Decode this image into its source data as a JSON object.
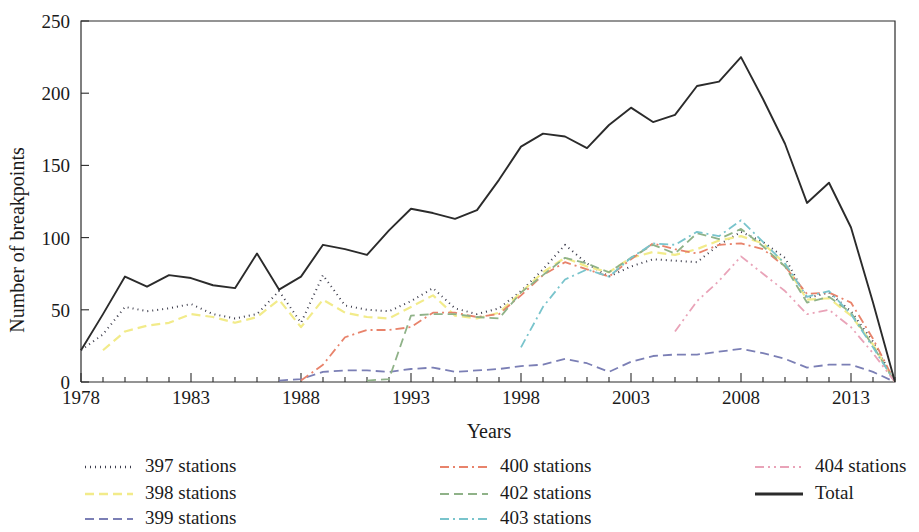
{
  "figure": {
    "background_color": "#ffffff",
    "frame_color": "#2b2b2b"
  },
  "axis": {
    "x_title": "Years",
    "y_title": "Number of breakpoints",
    "x_ticklabels": [
      "1978",
      "1983",
      "1988",
      "1993",
      "1998",
      "2003",
      "2008",
      "2013"
    ],
    "y_ticklabels": [
      "0",
      "50",
      "100",
      "150",
      "200",
      "250"
    ]
  },
  "legend": {
    "entries": [
      {
        "label": "397 stations",
        "color": "#3b3b4a",
        "dash": "1,4",
        "width": 2.0,
        "name": "legend-397"
      },
      {
        "label": "398 stations",
        "color": "#f2eb8a",
        "dash": "9,5",
        "width": 2.2,
        "name": "legend-398"
      },
      {
        "label": "399 stations",
        "color": "#7b7fb5",
        "dash": "9,5",
        "width": 1.8,
        "name": "legend-399"
      },
      {
        "label": "400 stations",
        "color": "#e8836b",
        "dash": "9,4,2,4",
        "width": 1.8,
        "name": "legend-400"
      },
      {
        "label": "402 stations",
        "color": "#8fb288",
        "dash": "9,5",
        "width": 1.8,
        "name": "legend-402"
      },
      {
        "label": "403 stations",
        "color": "#79c4cc",
        "dash": "9,4,2,4",
        "width": 1.8,
        "name": "legend-403"
      },
      {
        "label": "404 stations",
        "color": "#e9a3b8",
        "dash": "9,4,2,4,2,4",
        "width": 1.8,
        "name": "legend-404"
      },
      {
        "label": "Total",
        "color": "#2b2b2b",
        "dash": "none",
        "width": 1.9,
        "name": "legend-total"
      }
    ]
  },
  "chart_data": {
    "type": "line",
    "title": "",
    "xlabel": "Years",
    "ylabel": "Number of breakpoints",
    "xlim": [
      1978,
      2015
    ],
    "ylim": [
      0,
      250
    ],
    "grid": false,
    "legend_position": "bottom",
    "x": [
      1978,
      1979,
      1980,
      1981,
      1982,
      1983,
      1984,
      1985,
      1986,
      1987,
      1988,
      1989,
      1990,
      1991,
      1992,
      1993,
      1994,
      1995,
      1996,
      1997,
      1998,
      1999,
      2000,
      2001,
      2002,
      2003,
      2004,
      2005,
      2006,
      2007,
      2008,
      2009,
      2010,
      2011,
      2012,
      2013,
      2014,
      2015
    ],
    "series": [
      {
        "name": "397 stations",
        "color": "#3b3b4a",
        "values": [
          22,
          33,
          52,
          49,
          51,
          54,
          47,
          44,
          47,
          63,
          41,
          74,
          53,
          50,
          49,
          56,
          65,
          51,
          47,
          51,
          63,
          78,
          95,
          82,
          73,
          80,
          85,
          84,
          83,
          95,
          104,
          97,
          86,
          58,
          62,
          49,
          28,
          0
        ]
      },
      {
        "name": "398 stations",
        "color": "#f2eb8a",
        "values": [
          null,
          22,
          35,
          39,
          41,
          47,
          45,
          41,
          45,
          57,
          38,
          57,
          48,
          45,
          44,
          52,
          60,
          46,
          44,
          48,
          62,
          76,
          86,
          80,
          76,
          86,
          90,
          88,
          92,
          98,
          101,
          96,
          82,
          57,
          58,
          46,
          26,
          0
        ]
      },
      {
        "name": "399 stations",
        "color": "#7b7fb5",
        "values": [
          null,
          null,
          null,
          null,
          null,
          null,
          null,
          null,
          null,
          1,
          2,
          7,
          8,
          8,
          7,
          9,
          10,
          7,
          8,
          9,
          11,
          12,
          16,
          13,
          7,
          14,
          18,
          19,
          19,
          21,
          23,
          20,
          16,
          10,
          12,
          12,
          7,
          0
        ]
      },
      {
        "name": "400 stations",
        "color": "#e8836b",
        "values": [
          null,
          null,
          null,
          null,
          null,
          null,
          null,
          null,
          null,
          null,
          1,
          12,
          31,
          36,
          36,
          38,
          48,
          48,
          45,
          47,
          60,
          74,
          83,
          78,
          73,
          85,
          96,
          92,
          89,
          95,
          96,
          92,
          80,
          61,
          62,
          55,
          30,
          0
        ]
      },
      {
        "name": "402 stations",
        "color": "#8fb288",
        "values": [
          null,
          null,
          null,
          null,
          null,
          null,
          null,
          null,
          null,
          null,
          null,
          null,
          null,
          1,
          2,
          46,
          47,
          47,
          45,
          44,
          62,
          74,
          86,
          82,
          76,
          86,
          95,
          89,
          103,
          99,
          106,
          94,
          80,
          55,
          59,
          48,
          25,
          0
        ]
      },
      {
        "name": "403 stations",
        "color": "#79c4cc",
        "values": [
          null,
          null,
          null,
          null,
          null,
          null,
          null,
          null,
          null,
          null,
          null,
          null,
          null,
          null,
          null,
          null,
          null,
          null,
          null,
          null,
          24,
          52,
          71,
          78,
          73,
          86,
          96,
          95,
          104,
          101,
          112,
          97,
          82,
          59,
          63,
          47,
          24,
          0
        ]
      },
      {
        "name": "404 stations",
        "color": "#e9a3b8",
        "values": [
          null,
          null,
          null,
          null,
          null,
          null,
          null,
          null,
          null,
          null,
          null,
          null,
          null,
          null,
          null,
          null,
          null,
          null,
          null,
          null,
          null,
          null,
          null,
          null,
          null,
          null,
          null,
          35,
          56,
          70,
          87,
          75,
          63,
          47,
          50,
          38,
          20,
          0
        ]
      },
      {
        "name": "Total",
        "color": "#2b2b2b",
        "values": [
          22,
          47,
          73,
          66,
          74,
          72,
          67,
          65,
          89,
          64,
          73,
          95,
          92,
          88,
          105,
          120,
          117,
          113,
          119,
          140,
          163,
          172,
          170,
          162,
          178,
          190,
          180,
          185,
          205,
          208,
          225,
          196,
          165,
          124,
          138,
          107,
          55,
          0
        ]
      }
    ]
  }
}
